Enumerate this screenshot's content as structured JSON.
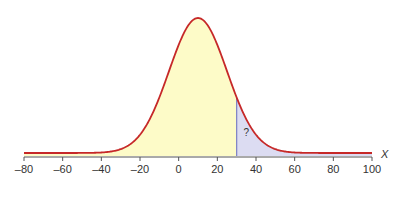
{
  "chart_data": {
    "type": "area",
    "title": "",
    "xlabel": "X",
    "ylabel": "",
    "distribution": {
      "name": "normal",
      "mean": 10,
      "sd": 15
    },
    "xlim": [
      -80,
      100
    ],
    "x_ticks": [
      -80,
      -60,
      -40,
      -20,
      0,
      20,
      40,
      60,
      80,
      100
    ],
    "x_tick_labels": [
      "–80",
      "–60",
      "–40",
      "–20",
      "0",
      "20",
      "40",
      "60",
      "80",
      "100"
    ],
    "shaded_regions": [
      {
        "from": -80,
        "to": 30,
        "color": "#fdfbc8",
        "label": ""
      },
      {
        "from": 30,
        "to": 100,
        "color": "#dcdcf2",
        "label": "?"
      }
    ],
    "boundary_x": 30,
    "annotation": "?",
    "grid": false,
    "legend": null
  },
  "colors": {
    "curve": "#c62828",
    "left_fill": "#fdfbc8",
    "right_fill": "#dcdcf2",
    "boundary_line": "#7b7fc4",
    "axis": "#555555",
    "text": "#333333"
  },
  "layout": {
    "axis_y": 156,
    "x_px_min": 24,
    "x_px_max": 372,
    "peak_y": 18
  }
}
